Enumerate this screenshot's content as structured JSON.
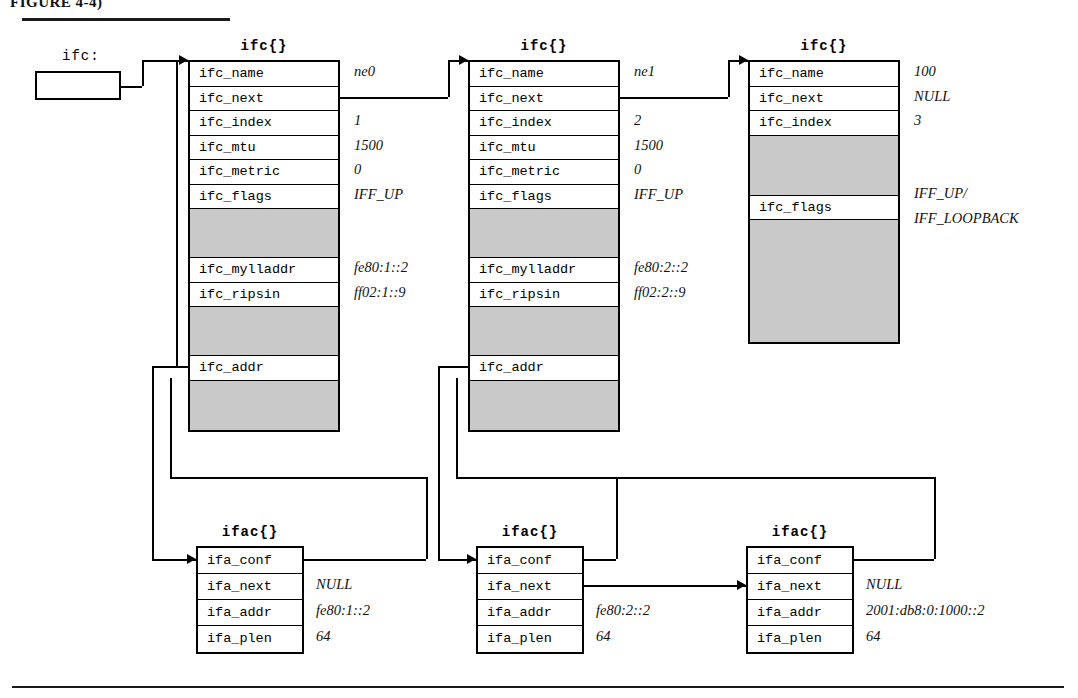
{
  "figure": {
    "caption": "FIGURE 4-4)"
  },
  "root_pointer": {
    "label": "ifc:"
  },
  "structs": {
    "ifc": [
      {
        "title": "ifc{}",
        "rows": [
          {
            "name": "ifc_name",
            "value": "ne0",
            "gap": false
          },
          {
            "name": "ifc_next",
            "value": "",
            "gap": false
          },
          {
            "name": "ifc_index",
            "value": "1",
            "gap": false
          },
          {
            "name": "ifc_mtu",
            "value": "1500",
            "gap": false
          },
          {
            "name": "ifc_metric",
            "value": "0",
            "gap": false
          },
          {
            "name": "ifc_flags",
            "value": "IFF_UP",
            "gap": false
          },
          {
            "name": "",
            "value": "",
            "gap": true
          },
          {
            "name": "ifc_mylladdr",
            "value": "fe80:1::2",
            "gap": false
          },
          {
            "name": "ifc_ripsin",
            "value": "ff02:1::9",
            "gap": false
          },
          {
            "name": "",
            "value": "",
            "gap": true
          },
          {
            "name": "ifc_addr",
            "value": "",
            "gap": false
          },
          {
            "name": "",
            "value": "",
            "gap": true
          }
        ]
      },
      {
        "title": "ifc{}",
        "rows": [
          {
            "name": "ifc_name",
            "value": "ne1",
            "gap": false
          },
          {
            "name": "ifc_next",
            "value": "",
            "gap": false
          },
          {
            "name": "ifc_index",
            "value": "2",
            "gap": false
          },
          {
            "name": "ifc_mtu",
            "value": "1500",
            "gap": false
          },
          {
            "name": "ifc_metric",
            "value": "0",
            "gap": false
          },
          {
            "name": "ifc_flags",
            "value": "IFF_UP",
            "gap": false
          },
          {
            "name": "",
            "value": "",
            "gap": true
          },
          {
            "name": "ifc_mylladdr",
            "value": "fe80:2::2",
            "gap": false
          },
          {
            "name": "ifc_ripsin",
            "value": "ff02:2::9",
            "gap": false
          },
          {
            "name": "",
            "value": "",
            "gap": true
          },
          {
            "name": "ifc_addr",
            "value": "",
            "gap": false
          },
          {
            "name": "",
            "value": "",
            "gap": true
          }
        ]
      },
      {
        "title": "ifc{}",
        "rows": [
          {
            "name": "ifc_name",
            "value": "100",
            "gap": false
          },
          {
            "name": "ifc_next",
            "value": "NULL",
            "gap": false
          },
          {
            "name": "ifc_index",
            "value": "3",
            "gap": false
          },
          {
            "name": "",
            "value": "",
            "gap": true
          },
          {
            "name": "ifc_flags",
            "value": "",
            "gap": false
          },
          {
            "name": "",
            "value": "",
            "gap": true
          }
        ],
        "flags_multiline": [
          "IFF_UP/",
          "IFF_LOOPBACK"
        ]
      }
    ],
    "ifac": [
      {
        "title": "ifac{}",
        "rows": [
          {
            "name": "ifa_conf",
            "value": ""
          },
          {
            "name": "ifa_next",
            "value": "NULL"
          },
          {
            "name": "ifa_addr",
            "value": "fe80:1::2"
          },
          {
            "name": "ifa_plen",
            "value": "64"
          }
        ]
      },
      {
        "title": "ifac{}",
        "rows": [
          {
            "name": "ifa_conf",
            "value": ""
          },
          {
            "name": "ifa_next",
            "value": ""
          },
          {
            "name": "ifa_addr",
            "value": "fe80:2::2"
          },
          {
            "name": "ifa_plen",
            "value": "64"
          }
        ]
      },
      {
        "title": "ifac{}",
        "rows": [
          {
            "name": "ifa_conf",
            "value": ""
          },
          {
            "name": "ifa_next",
            "value": "NULL"
          },
          {
            "name": "ifa_addr",
            "value": "2001:db8:0:1000::2"
          },
          {
            "name": "ifa_plen",
            "value": "64"
          }
        ]
      }
    ]
  },
  "colors": {
    "line": "#000000",
    "gap_fill": "#c9c9c9",
    "paper": "#ffffff"
  }
}
